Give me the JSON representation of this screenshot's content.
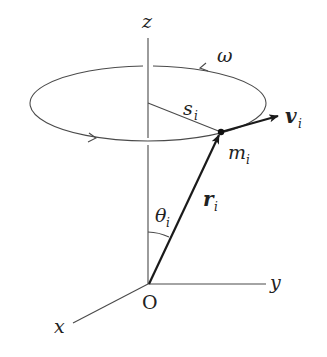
{
  "diagram": {
    "labels": {
      "z_axis": "z",
      "y_axis": "y",
      "x_axis": "x",
      "origin": "O",
      "omega": "ω",
      "s": "s",
      "s_sub": "i",
      "m": "m",
      "m_sub": "i",
      "v": "v",
      "v_sub": "i",
      "r": "r",
      "r_sub": "i",
      "theta": "θ",
      "theta_sub": "i"
    },
    "colors": {
      "line": "#4a4a4a",
      "vector": "#1a1a1a",
      "background": "#ffffff"
    }
  }
}
